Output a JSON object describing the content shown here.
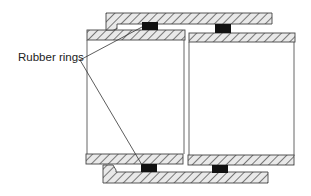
{
  "diagram": {
    "labels": {
      "rubber_rings": "Rubber rings"
    },
    "colors": {
      "wall_fill": "#ffffff",
      "hatch": "#555555",
      "outline": "#444444",
      "ring": "#111111",
      "leader": "#333333"
    },
    "components": [
      {
        "name": "outer-sleeve-top",
        "role": "coupling sleeve"
      },
      {
        "name": "outer-sleeve-bottom",
        "role": "coupling sleeve"
      },
      {
        "name": "left-pipe",
        "role": "pipe section"
      },
      {
        "name": "right-pipe",
        "role": "pipe section"
      },
      {
        "name": "rubber-ring",
        "count": 4
      }
    ]
  }
}
